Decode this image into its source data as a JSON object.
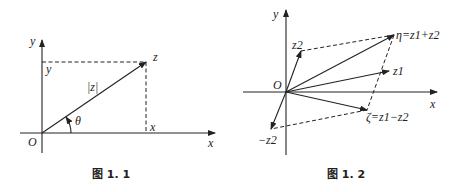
{
  "figure1": {
    "caption": "图 1. 1",
    "labels": {
      "y_axis": "y",
      "x_axis": "x",
      "origin": "O",
      "y_proj": "y",
      "x_proj": "x",
      "point": "z",
      "modulus": "|z|",
      "angle": "θ"
    }
  },
  "figure2": {
    "caption": "图 1. 2",
    "labels": {
      "y_axis": "y",
      "x_axis": "x",
      "origin": "O",
      "z1": "z1",
      "z2": "z2",
      "neg_z2": "−z2",
      "eta": "η=z1+z2",
      "zeta": "ζ=z1−z2"
    }
  }
}
